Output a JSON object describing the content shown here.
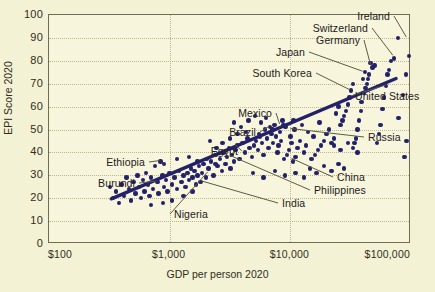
{
  "chart_data": {
    "type": "scatter",
    "title": "",
    "xlabel": "GDP per person 2020",
    "ylabel": "EPI Score 2020",
    "xscale": "log",
    "xlim": [
      100,
      100000
    ],
    "ylim": [
      0,
      100
    ],
    "grid": true,
    "legend": "none",
    "xticklabels": [
      "$100",
      "$1,000",
      "$10,000",
      "$100,000"
    ],
    "xtickvalues": [
      100,
      1000,
      10000,
      100000
    ],
    "yticklabels": [
      "0",
      "10",
      "20",
      "30",
      "40",
      "50",
      "60",
      "70",
      "80",
      "90",
      "100"
    ],
    "ytickvalues": [
      0,
      10,
      20,
      30,
      40,
      50,
      60,
      70,
      80,
      90,
      100
    ],
    "marker_color": "#232168",
    "trend_color": "#232168",
    "background_color": "#f4f2d4",
    "plot_background_color": "#f7f5dc",
    "axis_color": "#6f6d52",
    "grid_color": "#b9b690",
    "trendline": {
      "x0": 330,
      "y0": 19,
      "x1": 78000,
      "y1": 72
    },
    "annotations": [
      {
        "label": "Ireland",
        "x": 93000,
        "y": 90,
        "align": "right",
        "tx": 390,
        "ty": 16
      },
      {
        "label": "Switzerland",
        "x": 72000,
        "y": 82,
        "align": "right",
        "tx": 368,
        "ty": 28
      },
      {
        "label": "Germany",
        "x": 47000,
        "y": 78,
        "align": "right",
        "tx": 360,
        "ty": 40
      },
      {
        "label": "Japan",
        "x": 40500,
        "y": 75,
        "align": "right",
        "tx": 305,
        "ty": 52
      },
      {
        "label": "South Korea",
        "x": 31500,
        "y": 67,
        "align": "right",
        "tx": 312,
        "ty": 73
      },
      {
        "label": "United States",
        "x": 63000,
        "y": 69,
        "align": "left",
        "tx": 355,
        "ty": 96
      },
      {
        "label": "Mexico",
        "x": 8300,
        "y": 52,
        "align": "right",
        "tx": 272,
        "ty": 113
      },
      {
        "label": "Brazil",
        "x": 6800,
        "y": 51,
        "align": "right",
        "tx": 256,
        "ty": 132
      },
      {
        "label": "Russia",
        "x": 10200,
        "y": 50,
        "align": "left",
        "tx": 368,
        "ty": 137
      },
      {
        "label": "Egypt",
        "x": 3550,
        "y": 43,
        "align": "right",
        "tx": 238,
        "ty": 151
      },
      {
        "label": "Ethiopia",
        "x": 840,
        "y": 36,
        "align": "right",
        "tx": 145,
        "ty": 162
      },
      {
        "label": "China",
        "x": 10400,
        "y": 37,
        "align": "left",
        "tx": 337,
        "ty": 177
      },
      {
        "label": "Burundi",
        "x": 790,
        "y": 27,
        "align": "right",
        "tx": 135,
        "ty": 183
      },
      {
        "label": "Philippines",
        "x": 3300,
        "y": 38,
        "align": "left",
        "tx": 314,
        "ty": 190
      },
      {
        "label": "India",
        "x": 1900,
        "y": 27,
        "align": "left",
        "tx": 282,
        "ty": 203
      },
      {
        "label": "Nigeria",
        "x": 2100,
        "y": 31,
        "align": "left",
        "tx": 174,
        "ty": 214
      }
    ],
    "points": [
      [
        96000,
        82
      ],
      [
        91000,
        74
      ],
      [
        86000,
        65
      ],
      [
        79000,
        55
      ],
      [
        92000,
        45
      ],
      [
        88000,
        38
      ],
      [
        78000,
        90
      ],
      [
        72000,
        81
      ],
      [
        68000,
        80
      ],
      [
        66000,
        76
      ],
      [
        64000,
        74
      ],
      [
        62000,
        69
      ],
      [
        60000,
        64
      ],
      [
        58000,
        59
      ],
      [
        56000,
        52
      ],
      [
        54000,
        48
      ],
      [
        52000,
        44
      ],
      [
        50000,
        78
      ],
      [
        48000,
        77
      ],
      [
        46000,
        79
      ],
      [
        45000,
        74
      ],
      [
        44000,
        72
      ],
      [
        43000,
        70
      ],
      [
        42000,
        68
      ],
      [
        41500,
        75
      ],
      [
        41000,
        66
      ],
      [
        40000,
        72
      ],
      [
        39000,
        62
      ],
      [
        38500,
        58
      ],
      [
        37000,
        54
      ],
      [
        36000,
        50
      ],
      [
        35000,
        46
      ],
      [
        34000,
        44
      ],
      [
        33000,
        70
      ],
      [
        32000,
        67
      ],
      [
        31000,
        64
      ],
      [
        30000,
        61
      ],
      [
        29000,
        58
      ],
      [
        28000,
        56
      ],
      [
        27000,
        54
      ],
      [
        26000,
        52
      ],
      [
        25000,
        60
      ],
      [
        24000,
        57
      ],
      [
        23000,
        46
      ],
      [
        22000,
        44
      ],
      [
        21000,
        50
      ],
      [
        20000,
        48
      ],
      [
        19000,
        45
      ],
      [
        18000,
        43
      ],
      [
        17500,
        53
      ],
      [
        17000,
        41
      ],
      [
        16000,
        39
      ],
      [
        15500,
        47
      ],
      [
        15000,
        37
      ],
      [
        14000,
        49
      ],
      [
        13500,
        43
      ],
      [
        13000,
        40
      ],
      [
        12500,
        52
      ],
      [
        12000,
        45
      ],
      [
        11500,
        42
      ],
      [
        11000,
        38
      ],
      [
        10800,
        50
      ],
      [
        10500,
        36
      ],
      [
        10200,
        44
      ],
      [
        10000,
        47
      ],
      [
        9700,
        41
      ],
      [
        9400,
        39
      ],
      [
        9100,
        51
      ],
      [
        8900,
        37
      ],
      [
        8600,
        54
      ],
      [
        8400,
        45
      ],
      [
        8200,
        49
      ],
      [
        8000,
        43
      ],
      [
        7800,
        40
      ],
      [
        7600,
        47
      ],
      [
        7400,
        52
      ],
      [
        7200,
        44
      ],
      [
        7000,
        48
      ],
      [
        6800,
        51
      ],
      [
        6600,
        42
      ],
      [
        6400,
        46
      ],
      [
        6200,
        50
      ],
      [
        6000,
        39
      ],
      [
        5800,
        44
      ],
      [
        5600,
        47
      ],
      [
        5400,
        41
      ],
      [
        5200,
        45
      ],
      [
        5000,
        43
      ],
      [
        4800,
        38
      ],
      [
        4600,
        42
      ],
      [
        4400,
        46
      ],
      [
        4200,
        40
      ],
      [
        4000,
        44
      ],
      [
        3800,
        37
      ],
      [
        3600,
        43
      ],
      [
        3500,
        41
      ],
      [
        3400,
        36
      ],
      [
        3300,
        39
      ],
      [
        3200,
        33
      ],
      [
        3100,
        42
      ],
      [
        3000,
        38
      ],
      [
        2900,
        35
      ],
      [
        2800,
        40
      ],
      [
        2700,
        32
      ],
      [
        2600,
        37
      ],
      [
        2500,
        34
      ],
      [
        2400,
        39
      ],
      [
        2300,
        30
      ],
      [
        2200,
        36
      ],
      [
        2100,
        33
      ],
      [
        2000,
        29
      ],
      [
        1900,
        35
      ],
      [
        1850,
        31
      ],
      [
        1800,
        27
      ],
      [
        1750,
        34
      ],
      [
        1700,
        30
      ],
      [
        1650,
        26
      ],
      [
        1600,
        32
      ],
      [
        1550,
        29
      ],
      [
        1500,
        33
      ],
      [
        1450,
        28
      ],
      [
        1400,
        31
      ],
      [
        1350,
        25
      ],
      [
        1300,
        30
      ],
      [
        1250,
        27
      ],
      [
        1200,
        32
      ],
      [
        1150,
        24
      ],
      [
        1100,
        29
      ],
      [
        1050,
        26
      ],
      [
        1000,
        31
      ],
      [
        960,
        23
      ],
      [
        930,
        28
      ],
      [
        900,
        25
      ],
      [
        870,
        30
      ],
      [
        840,
        36
      ],
      [
        810,
        22
      ],
      [
        790,
        27
      ],
      [
        760,
        34
      ],
      [
        730,
        24
      ],
      [
        700,
        29
      ],
      [
        680,
        21
      ],
      [
        660,
        26
      ],
      [
        640,
        31
      ],
      [
        620,
        23
      ],
      [
        600,
        28
      ],
      [
        580,
        20
      ],
      [
        560,
        25
      ],
      [
        540,
        30
      ],
      [
        520,
        22
      ],
      [
        500,
        27
      ],
      [
        480,
        19
      ],
      [
        460,
        24
      ],
      [
        440,
        29
      ],
      [
        420,
        21
      ],
      [
        400,
        26
      ],
      [
        380,
        18
      ],
      [
        360,
        23
      ],
      [
        340,
        20
      ],
      [
        320,
        25
      ],
      [
        3400,
        53
      ],
      [
        3900,
        51
      ],
      [
        4500,
        54
      ],
      [
        5100,
        56
      ],
      [
        5700,
        53
      ],
      [
        6300,
        55
      ],
      [
        14500,
        33
      ],
      [
        16500,
        31
      ],
      [
        19000,
        34
      ],
      [
        22000,
        32
      ],
      [
        25000,
        35
      ],
      [
        28000,
        33
      ],
      [
        13000,
        29
      ],
      [
        11000,
        31
      ],
      [
        9000,
        30
      ],
      [
        7500,
        32
      ],
      [
        6000,
        29
      ],
      [
        4900,
        31
      ],
      [
        33000,
        42
      ],
      [
        36000,
        40
      ],
      [
        30000,
        44
      ],
      [
        26000,
        41
      ],
      [
        23000,
        43
      ],
      [
        1450,
        38
      ],
      [
        1700,
        36
      ],
      [
        2050,
        37
      ],
      [
        2400,
        35
      ],
      [
        900,
        35
      ],
      [
        1150,
        37
      ],
      [
        4300,
        49
      ],
      [
        5500,
        48
      ],
      [
        7100,
        50
      ],
      [
        8800,
        52
      ],
      [
        10600,
        54
      ],
      [
        2750,
        44
      ],
      [
        3150,
        46
      ],
      [
        3650,
        48
      ],
      [
        2450,
        42
      ],
      [
        2150,
        45
      ],
      [
        1300,
        21
      ],
      [
        1550,
        23
      ],
      [
        1050,
        19
      ],
      [
        880,
        18
      ],
      [
        700,
        17
      ]
    ]
  }
}
